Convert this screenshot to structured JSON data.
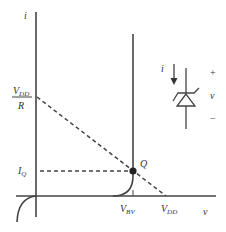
{
  "diagram": {
    "axes": {
      "y_label": "i",
      "x_label": "v"
    },
    "labels": {
      "vdd_r_num_main": "V",
      "vdd_r_num_sub": "DD",
      "vdd_r_den": "R",
      "iq_main": "I",
      "iq_sub": "Q",
      "q_point": "Q",
      "vbv_main": "V",
      "vbv_sub": "BV",
      "vdd_main": "V",
      "vdd_sub": "DD"
    },
    "symbol": {
      "type": "zener-diode",
      "current_label": "i",
      "plus": "+",
      "voltage_label": "v",
      "minus": "−"
    },
    "colors": {
      "line": "#333333",
      "background": "#ffffff"
    }
  }
}
